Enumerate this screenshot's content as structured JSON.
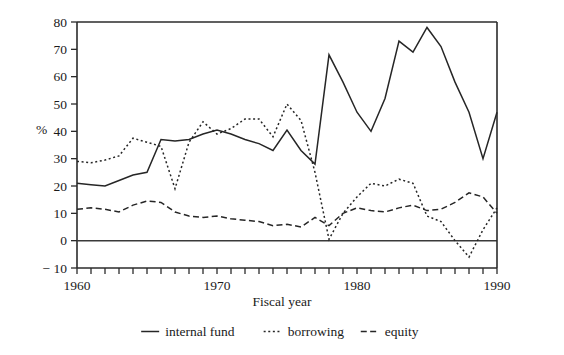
{
  "chart_data": {
    "type": "line",
    "title": "",
    "xlabel": "Fiscal year",
    "ylabel": "%",
    "xlim": [
      1960,
      1990
    ],
    "ylim": [
      -10,
      80
    ],
    "ytick_step": 10,
    "xtick_step": 1,
    "xtick_label_step": 10,
    "grid": false,
    "legend_position": "below-axis-center",
    "x": [
      1960,
      1961,
      1962,
      1963,
      1964,
      1965,
      1966,
      1967,
      1968,
      1969,
      1970,
      1971,
      1972,
      1973,
      1974,
      1975,
      1976,
      1977,
      1978,
      1979,
      1980,
      1981,
      1982,
      1983,
      1984,
      1985,
      1986,
      1987,
      1988,
      1989,
      1990
    ],
    "xtick_labels": [
      "1960",
      "1970",
      "1980",
      "1990"
    ],
    "ytick_labels": [
      "80",
      "70",
      "60",
      "50",
      "40",
      "30",
      "20",
      "10",
      "0",
      "− 10"
    ],
    "series": [
      {
        "name": "internal fund",
        "style": "solid",
        "values": [
          21,
          20.5,
          20,
          22,
          24,
          25,
          37,
          36.5,
          37,
          39,
          40.5,
          39,
          37,
          35.5,
          33,
          40.5,
          33,
          28,
          68,
          58,
          47,
          40,
          52,
          73,
          69,
          78,
          71,
          58,
          47,
          30,
          47
        ]
      },
      {
        "name": "borrowing",
        "style": "dotted",
        "values": [
          29,
          28.5,
          29.5,
          31,
          37.5,
          36,
          34.5,
          19,
          36,
          43.5,
          39,
          41,
          44.5,
          44.5,
          38,
          50,
          44,
          25,
          0.5,
          10,
          16,
          21,
          20,
          22.5,
          21,
          9,
          7,
          0,
          -6,
          4,
          12
        ]
      },
      {
        "name": "equity",
        "style": "dashed",
        "values": [
          11.5,
          12,
          11.5,
          10.5,
          13,
          14.5,
          14,
          10.5,
          9,
          8.5,
          9,
          8,
          7.5,
          7,
          5.5,
          6,
          5,
          8.5,
          5.5,
          10,
          12,
          11,
          10.5,
          12,
          13,
          11,
          11.5,
          14,
          17.5,
          16,
          10
        ]
      }
    ]
  },
  "legend": {
    "items": [
      {
        "label": "internal fund",
        "style": "solid"
      },
      {
        "label": "borrowing",
        "style": "dotted"
      },
      {
        "label": "equity",
        "style": "dashed"
      }
    ]
  }
}
